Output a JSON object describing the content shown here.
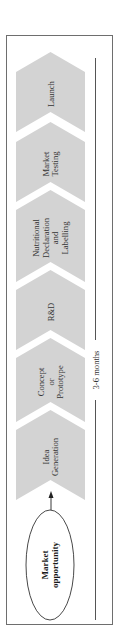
{
  "diagram": {
    "colors": {
      "chevron_fill": "#d3d3d3",
      "frame_stroke": "#6e6e6e",
      "text": "#333333",
      "background": "#ffffff"
    },
    "start_node": {
      "label_lines": [
        "Market",
        "opportunity"
      ]
    },
    "stages": [
      {
        "id": "idea-generation",
        "label_lines": [
          "Idea",
          "Generation"
        ],
        "tip": 410,
        "notch": 480
      },
      {
        "id": "concept-prototype",
        "label_lines": [
          "Concept",
          "or",
          "Prototype"
        ],
        "tip": 338,
        "notch": 402
      },
      {
        "id": "r-and-d",
        "label_lines": [
          "R&D"
        ],
        "tip": 270,
        "notch": 330
      },
      {
        "id": "nutritional-declaration",
        "label_lines": [
          "Nutritional",
          "Declaration",
          "and",
          "Labelling"
        ],
        "tip": 190,
        "notch": 262
      },
      {
        "id": "market-testing",
        "label_lines": [
          "Market",
          "Testing"
        ],
        "tip": 122,
        "notch": 182
      },
      {
        "id": "launch",
        "label_lines": [
          "Launch"
        ],
        "tip": 52,
        "notch": 112
      }
    ],
    "timeline": {
      "label": "3-6 months"
    }
  }
}
